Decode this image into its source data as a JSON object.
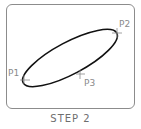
{
  "diagram": {
    "caption": "STEP 2",
    "points": [
      {
        "label": "P1",
        "x": 24,
        "y": 79
      },
      {
        "label": "P2",
        "x": 117,
        "y": 33
      },
      {
        "label": "P3",
        "x": 80,
        "y": 75
      }
    ],
    "ellipse": {
      "cx": 70,
      "cy": 58,
      "rx": 53,
      "ry": 16,
      "rotation_deg": -28
    },
    "colors": {
      "ellipse_stroke": "#111111",
      "frame_border": "#8c8c8c",
      "label_text": "#8a8a8a",
      "marker": "#8a8a8a"
    }
  }
}
